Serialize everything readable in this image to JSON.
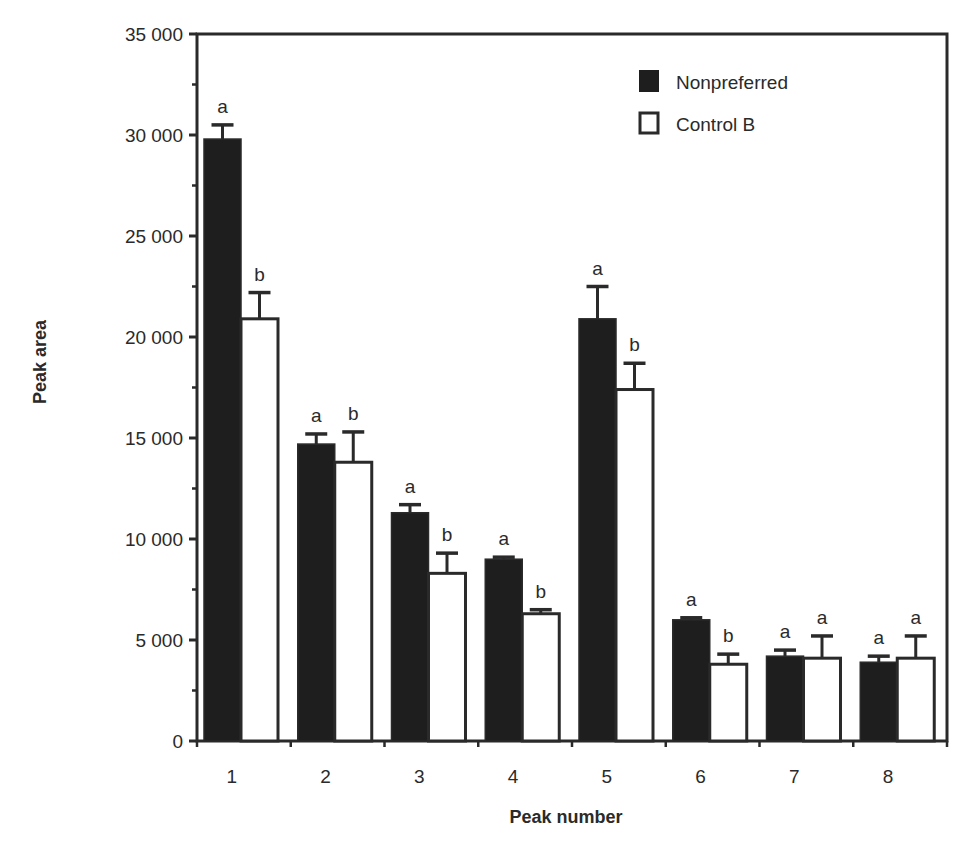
{
  "chart_data": {
    "type": "bar",
    "title": "",
    "xlabel": "Peak number",
    "ylabel": "Peak area",
    "ylim": [
      0,
      35000
    ],
    "yticks": [
      0,
      5000,
      10000,
      15000,
      20000,
      25000,
      30000,
      35000
    ],
    "ytick_labels": [
      "0",
      "5 000",
      "10 000",
      "15 000",
      "20 000",
      "25 000",
      "30 000",
      "35 000"
    ],
    "categories": [
      "1",
      "2",
      "3",
      "4",
      "5",
      "6",
      "7",
      "8"
    ],
    "grid": false,
    "legend_position": "upper right",
    "series": [
      {
        "name": "Nonpreferred",
        "color": "#1e1e1e",
        "values": [
          29800,
          14700,
          11300,
          9000,
          20900,
          6000,
          4200,
          3900
        ],
        "error_upper": [
          30500,
          15200,
          11700,
          9100,
          22500,
          6100,
          4500,
          4200
        ],
        "significance": [
          "a",
          "a",
          "a",
          "a",
          "a",
          "a",
          "a",
          "a"
        ]
      },
      {
        "name": "Control B",
        "color": "#ffffff",
        "values": [
          20900,
          13800,
          8300,
          6300,
          17400,
          3800,
          4100,
          4100
        ],
        "error_upper": [
          22200,
          15300,
          9300,
          6500,
          18700,
          4300,
          5200,
          5200
        ],
        "significance": [
          "b",
          "b",
          "b",
          "b",
          "b",
          "b",
          "a",
          "a"
        ]
      }
    ]
  },
  "legend": {
    "items": [
      {
        "label": "Nonpreferred",
        "swatch": "filled"
      },
      {
        "label": "Control B",
        "swatch": "open"
      }
    ]
  },
  "axes": {
    "x_title": "Peak number",
    "y_title": "Peak area"
  }
}
